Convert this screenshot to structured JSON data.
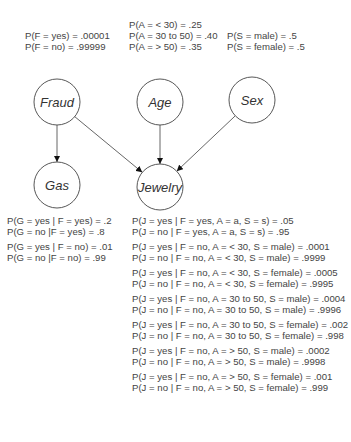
{
  "diagram": {
    "type": "bayesian-network",
    "nodes": [
      {
        "id": "fraud",
        "label": "Fraud",
        "cx": 57,
        "cy": 102,
        "r": 23
      },
      {
        "id": "age",
        "label": "Age",
        "cx": 160,
        "cy": 102,
        "r": 23
      },
      {
        "id": "sex",
        "label": "Sex",
        "cx": 252,
        "cy": 100,
        "r": 23
      },
      {
        "id": "gas",
        "label": "Gas",
        "cx": 57,
        "cy": 185,
        "r": 23
      },
      {
        "id": "jewelry",
        "label": "Jewelry",
        "cx": 160,
        "cy": 187,
        "r": 23
      }
    ],
    "edges": [
      {
        "from": "fraud",
        "to": "gas"
      },
      {
        "from": "fraud",
        "to": "jewelry"
      },
      {
        "from": "age",
        "to": "jewelry"
      },
      {
        "from": "sex",
        "to": "jewelry"
      }
    ]
  },
  "fraud_probs": [
    "P(F = yes) = .00001",
    "P(F = no) = .99999"
  ],
  "age_probs": [
    "P(A = < 30) = .25",
    "P(A = 30 to 50) = .40",
    "P(A = > 50) = .35"
  ],
  "sex_probs": [
    "P(S = male) = .5",
    "P(S = female) = .5"
  ],
  "gas_probs": [
    [
      "P(G = yes | F = yes) = .2",
      "P(G = no |F = yes) = .8"
    ],
    [
      "P(G = yes | F = no) = .01",
      "P(G = no |F = no) = .99"
    ]
  ],
  "jewelry_probs": [
    [
      "P(J = yes | F = yes, A = a, S = s) = .05",
      "P(J = no | F = yes, A = a, S = s) = .95"
    ],
    [
      "P(J = yes | F = no, A = < 30, S = male) = .0001",
      "P(J = no | F = no, A = < 30, S = male) = .9999"
    ],
    [
      "P(J = yes | F = no, A = < 30, S = female) = .0005",
      "P(J = no | F = no, A = < 30, S = female) = .9995"
    ],
    [
      "P(J = yes | F = no, A = 30 to 50, S = male) = .0004",
      "P(J = no | F = no, A = 30 to 50, S = male) = .9996"
    ],
    [
      "P(J = yes | F = no, A = 30 to 50, S = female) = .002",
      "P(J = no | F = no, A = 30 to 50, S = female) = .998"
    ],
    [
      "P(J = yes | F = no, A = > 50, S = male) = .0002",
      "P(J = no | F = no, A = > 50, S = male) = .9998"
    ],
    [
      "P(J = yes | F = no, A = > 50, S = female) = .001",
      "P(J = no | F = no, A = > 50, S = female) = .999"
    ]
  ]
}
